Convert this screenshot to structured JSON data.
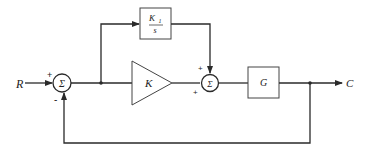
{
  "diagram": {
    "type": "block-diagram",
    "input": {
      "label": "R"
    },
    "output": {
      "label": "C"
    },
    "summing_junctions": [
      {
        "id": "sum1",
        "symbol": "Σ",
        "signs": {
          "top": "+",
          "bottom": "-"
        }
      },
      {
        "id": "sum2",
        "symbol": "Σ",
        "signs": {
          "top": "+",
          "left": "+"
        }
      }
    ],
    "blocks": [
      {
        "id": "integral",
        "numerator": "K",
        "numerator_sub": "1",
        "denominator": "s"
      },
      {
        "id": "gain",
        "label": "K",
        "shape": "triangle"
      },
      {
        "id": "plant",
        "label": "G"
      }
    ],
    "colors": {
      "line": "#2a2a2a",
      "background": "#ffffff"
    }
  }
}
